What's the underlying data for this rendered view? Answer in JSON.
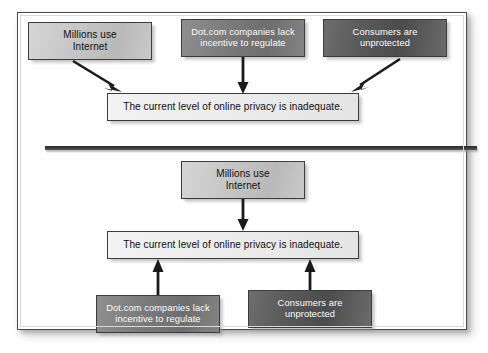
{
  "figure": {
    "type": "argument-map",
    "panels": [
      {
        "id": "panel-top",
        "pattern": "convergent",
        "premises": [
          {
            "id": "p-millions",
            "text_line1": "Millions use",
            "text_line2": "Internet",
            "tone": "light"
          },
          {
            "id": "p-dotcom",
            "text_line1": "Dot.com companies lack",
            "text_line2": "incentive to regulate",
            "tone": "mid"
          },
          {
            "id": "p-consumers",
            "text_line1": "Consumers are",
            "text_line2": "unprotected",
            "tone": "dark"
          }
        ],
        "conclusion": {
          "id": "c-privacy",
          "text": "The current level of online privacy is inadequate.",
          "tone": "pale"
        },
        "arrows": [
          {
            "from": "p-millions",
            "to": "c-privacy",
            "direction": "down-right"
          },
          {
            "from": "p-dotcom",
            "to": "c-privacy",
            "direction": "down"
          },
          {
            "from": "p-consumers",
            "to": "c-privacy",
            "direction": "down-left"
          }
        ]
      },
      {
        "id": "panel-bottom",
        "pattern": "divergent",
        "premises": [
          {
            "id": "p-millions-2",
            "text_line1": "Millions use",
            "text_line2": "Internet",
            "tone": "light"
          },
          {
            "id": "p-dotcom-2",
            "text_line1": "Dot.com companies lack",
            "text_line2": "incentive to regulate",
            "tone": "mid"
          },
          {
            "id": "p-consumers-2",
            "text_line1": "Consumers are",
            "text_line2": "unprotected",
            "tone": "dark"
          }
        ],
        "conclusion": {
          "id": "c-privacy-2",
          "text": "The current level of online privacy is inadequate.",
          "tone": "pale"
        },
        "arrows": [
          {
            "from": "p-millions-2",
            "to": "c-privacy-2",
            "direction": "down"
          },
          {
            "from": "p-dotcom-2",
            "to": "c-privacy-2",
            "direction": "up"
          },
          {
            "from": "p-consumers-2",
            "to": "c-privacy-2",
            "direction": "up"
          }
        ]
      }
    ],
    "colors": {
      "border": "#3c3c3c",
      "divider": "#2a2a2a",
      "arrow": "#1a1a1a",
      "tone_light": "#c6c6c6",
      "tone_pale": "#ececec",
      "tone_mid": "#7c7c7c",
      "tone_dark": "#5a5a5a",
      "text_on_light": "#101010",
      "text_on_dark": "#fdfdfd",
      "card_background": "#ffffff"
    }
  }
}
